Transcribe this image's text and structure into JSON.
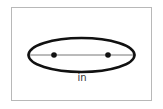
{
  "diagram": {
    "label": "in",
    "colors": {
      "frame": "#b8b8b8",
      "ellipse": "#111111",
      "axis": "#777777",
      "foci": "#111111",
      "label": "#333333"
    },
    "ellipse": {
      "cx": 81.5,
      "cy": 55,
      "rx": 53,
      "ry": 17
    },
    "foci": [
      {
        "x": 54,
        "y": 55
      },
      {
        "x": 108,
        "y": 55
      }
    ]
  }
}
